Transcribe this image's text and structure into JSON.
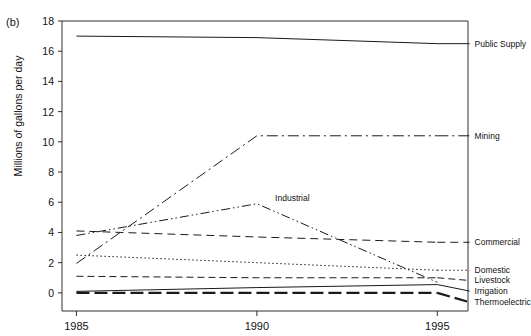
{
  "figure": {
    "panel_label": "(b)",
    "background": "#ffffff",
    "line_color": "#1a1a1a"
  },
  "chart_data": {
    "type": "line",
    "title": "",
    "xlabel": "",
    "ylabel": "Millions of gallons per day",
    "x": [
      1985,
      1990,
      1995
    ],
    "xtick_labels": [
      "1985",
      "1990",
      "1995"
    ],
    "ytick_labels": [
      "0",
      "2",
      "4",
      "6",
      "8",
      "10",
      "12",
      "14",
      "16",
      "18"
    ],
    "yticks": [
      0,
      2,
      4,
      6,
      8,
      10,
      12,
      14,
      16,
      18
    ],
    "ylim": [
      -1.2,
      18
    ],
    "xlim": [
      1984.6,
      1995.85
    ],
    "grid": false,
    "legend_position": "right-inline-labels",
    "series": [
      {
        "name": "Public Supply",
        "values": [
          17.0,
          16.9,
          16.5
        ],
        "style": "solid",
        "dasharray": "",
        "width": 1.0,
        "label_x": 1995.95,
        "label_y": 16.5
      },
      {
        "name": "Mining",
        "values": [
          1.95,
          10.4,
          10.4
        ],
        "style": "long-dash-dot",
        "dasharray": "11,4,2,4",
        "width": 1.0,
        "label_x": 1995.95,
        "label_y": 10.4
      },
      {
        "name": "Industrial",
        "values": [
          3.8,
          5.9,
          0.7
        ],
        "style": "dash-dot-dot",
        "dasharray": "9,3,1.5,3,1.5,3",
        "width": 1.0,
        "label_x": 1990.45,
        "label_y": 6.25,
        "label_inline": true
      },
      {
        "name": "Commercial",
        "values": [
          4.1,
          3.7,
          3.35
        ],
        "style": "dashed",
        "dasharray": "8,5",
        "width": 1.0,
        "label_x": 1995.95,
        "label_y": 3.35
      },
      {
        "name": "Domestic",
        "values": [
          2.5,
          2.0,
          1.5
        ],
        "style": "dotted",
        "dasharray": "1.5,2.5",
        "width": 1.0,
        "label_x": 1995.95,
        "label_y": 1.5
      },
      {
        "name": "Livestock",
        "values": [
          1.1,
          1.0,
          1.0
        ],
        "style": "medium-dash",
        "dasharray": "7,4",
        "width": 1.0,
        "label_x": 1995.95,
        "label_y": 0.82
      },
      {
        "name": "Irrigation",
        "values": [
          0.1,
          0.35,
          0.55
        ],
        "style": "solid-thin",
        "dasharray": "",
        "width": 1.0,
        "label_x": 1995.95,
        "label_y": 0.12
      },
      {
        "name": "Thermoelectric",
        "values": [
          0.0,
          0.0,
          0.0
        ],
        "style": "thick-dash",
        "dasharray": "13,5",
        "width": 2.2,
        "label_x": 1995.95,
        "label_y": -0.62
      }
    ]
  }
}
